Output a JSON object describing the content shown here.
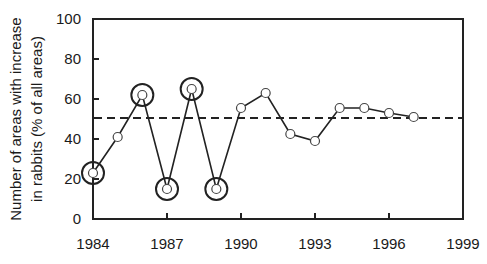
{
  "chart_data": {
    "type": "line",
    "title": "",
    "xlabel": "",
    "ylabel": [
      "Number of areas with increase",
      "in rabbits (% of all areas)"
    ],
    "xlim": [
      1984,
      1999
    ],
    "ylim": [
      0,
      100
    ],
    "xticks": [
      1984,
      1987,
      1990,
      1993,
      1996,
      1999
    ],
    "yticks": [
      0,
      20,
      40,
      60,
      80,
      100
    ],
    "grid": false,
    "legend": null,
    "series": [
      {
        "name": "Areas with increase in rabbits",
        "x": [
          1984,
          1985,
          1986,
          1987,
          1988,
          1989,
          1990,
          1991,
          1992,
          1993,
          1994,
          1995,
          1996,
          1997
        ],
        "values": [
          23,
          41,
          62,
          15,
          65,
          15,
          55.5,
          63,
          42.5,
          39,
          55.5,
          55.5,
          53,
          51
        ],
        "marker": "open-circle"
      }
    ],
    "highlighted_years": [
      1984,
      1986,
      1987,
      1988,
      1989
    ],
    "reference_line": {
      "y": 50.5,
      "style": "dashed"
    }
  },
  "colors": {
    "line": "#222222",
    "marker_fill": "#ffffff",
    "axis": "#222222",
    "text": "#1a1a1a"
  }
}
